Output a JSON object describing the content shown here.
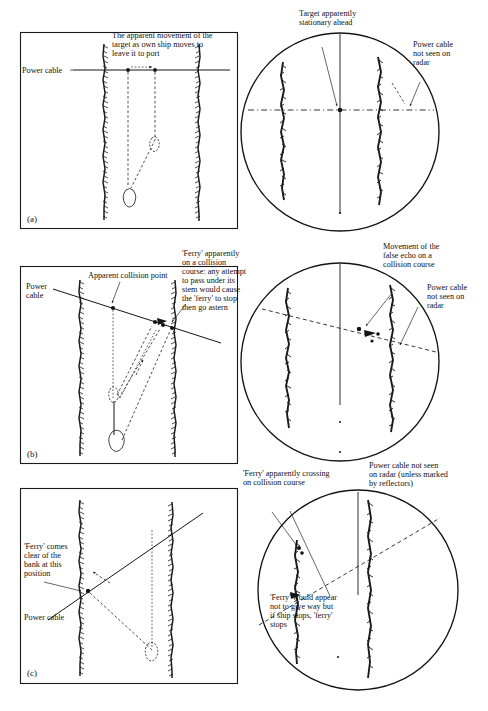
{
  "figure": {
    "panels": [
      {
        "id": "a",
        "letter": "(a)",
        "plan": {
          "labels": [
            {
              "name": "power-cable",
              "text": "Power cable"
            },
            {
              "name": "apparent-movement",
              "text": "The apparent movement of the\ntarget as own ship moves to\nleave it to port"
            }
          ]
        },
        "radar": {
          "labels": [
            {
              "name": "target-stationary",
              "text": "Target apparently\nstationary ahead"
            },
            {
              "name": "cable-not-seen",
              "text": "Power cable\nnot seen on\nradar"
            }
          ]
        }
      },
      {
        "id": "b",
        "letter": "(b)",
        "plan": {
          "labels": [
            {
              "name": "power-cable",
              "text": "Power\ncable"
            },
            {
              "name": "collision-point",
              "text": "Apparent collision point"
            },
            {
              "name": "ferry-collision-course",
              "text": "'Ferry' apparently\non a collision\ncourse: any attempt\nto pass under its\nstem would cause\nthe 'ferry' to stop\nthen go astern"
            }
          ]
        },
        "radar": {
          "labels": [
            {
              "name": "false-echo-movement",
              "text": "Movement of the\nfalse echo on a\ncollision course"
            },
            {
              "name": "cable-not-seen",
              "text": "Power cable\nnot seen on\nradar"
            }
          ]
        }
      },
      {
        "id": "c",
        "letter": "(c)",
        "plan": {
          "labels": [
            {
              "name": "ferry-clear-of-bank",
              "text": "'Ferry' comes\nclear of the\nbank at this\nposition"
            },
            {
              "name": "power-cable",
              "text": "Power cable"
            }
          ]
        },
        "radar": {
          "labels": [
            {
              "name": "ferry-crossing",
              "text": "'Ferry' apparently crossing\non collision course"
            },
            {
              "name": "cable-not-seen-reflectors",
              "text": "Power cable not seen\non radar (unless marked\nby reflectors)"
            },
            {
              "name": "ferry-give-way",
              "text": "'Ferry' would appear\nnot to give way but\nif ship stops, 'ferry'\nstops"
            }
          ]
        }
      }
    ],
    "colors": {
      "ink": "#141414",
      "paper": "#ffffff"
    }
  }
}
